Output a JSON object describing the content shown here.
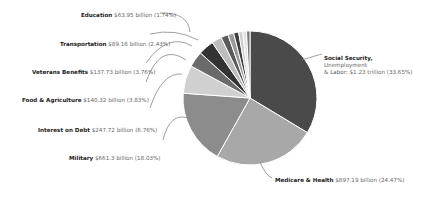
{
  "chart_data": {
    "type": "pie",
    "title": "",
    "start_angle_deg": 0,
    "direction": "clockwise",
    "slices": [
      {
        "label": "Social Security, Unemployment & Labor",
        "value_text": "$1.23 trillion",
        "percent": 33.65,
        "color": "#4a4a4a"
      },
      {
        "label": "Medicare & Health",
        "value_text": "$897.19 billion",
        "percent": 24.47,
        "color": "#a8a8a8"
      },
      {
        "label": "Military",
        "value_text": "$661.3 billion",
        "percent": 18.03,
        "color": "#8c8c8c"
      },
      {
        "label": "Interest on Debt",
        "value_text": "$247.72 billion",
        "percent": 6.76,
        "color": "#d0d0d0"
      },
      {
        "label": "Food & Agriculture",
        "value_text": "$140.32 billion",
        "percent": 3.83,
        "color": "#6a6a6a"
      },
      {
        "label": "Veterans Benefits",
        "value_text": "$137.73 billion",
        "percent": 3.76,
        "color": "#333333"
      },
      {
        "label": "Transportation",
        "value_text": "$89.16 billion",
        "percent": 2.43,
        "color": "#bdbdbd"
      },
      {
        "label": "Education",
        "value_text": "$63.95 billion",
        "percent": 1.74,
        "color": "#5a5a5a"
      },
      {
        "label": "",
        "value_text": "",
        "percent": 1.4,
        "color": "#9a9a9a"
      },
      {
        "label": "",
        "value_text": "",
        "percent": 1.2,
        "color": "#3e3e3e"
      },
      {
        "label": "",
        "value_text": "",
        "percent": 1.0,
        "color": "#cfcfcf"
      },
      {
        "label": "",
        "value_text": "",
        "percent": 0.9,
        "color": "#e2e2e2"
      },
      {
        "label": "",
        "value_text": "",
        "percent": 0.83,
        "color": "#787878"
      }
    ]
  },
  "labels": {
    "education": {
      "name": "Education",
      "value": "$63.95 billion (1.74%)"
    },
    "transportation": {
      "name": "Transportation",
      "value": "$89.16 billion (2.43%)"
    },
    "veterans": {
      "name": "Veterans Benefits",
      "value": "$137.73 billion (3.76%)"
    },
    "food": {
      "name": "Food & Agriculture",
      "value": "$140.32 billion (3.83%)"
    },
    "interest": {
      "name": "Interest on Debt",
      "value": "$247.72 billion (6.76%)"
    },
    "military": {
      "name": "Military",
      "value": "$661.3 billion (18.03%)"
    },
    "social_line1": "Social Security,",
    "social_line2": "Unemployment",
    "social_line3_name": "& Labor:",
    "social_value": "$1.23 trillion (33.65%)",
    "medicare": {
      "name": "Medicare & Health",
      "value": "$897.19 billion (24.47%)"
    }
  }
}
